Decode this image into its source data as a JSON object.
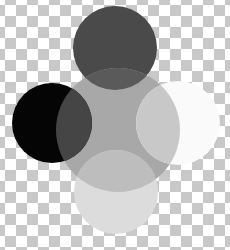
{
  "image": {
    "description": "Overlapping grayscale circles on transparency checkerboard",
    "circles": [
      {
        "name": "top-dark-circle",
        "color": "#4a4a4a"
      },
      {
        "name": "center-gray-circle",
        "color": "#a8a8a8"
      },
      {
        "name": "left-black-circle",
        "color": "#050505"
      },
      {
        "name": "right-white-circle",
        "color": "#fafafa"
      },
      {
        "name": "bottom-light-circle",
        "color": "#dcdcdc"
      }
    ]
  }
}
